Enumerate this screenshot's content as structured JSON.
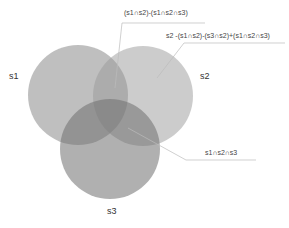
{
  "diagram": {
    "type": "venn",
    "sets": [
      {
        "id": "s1",
        "label": "s1"
      },
      {
        "id": "s2",
        "label": "s2"
      },
      {
        "id": "s3",
        "label": "s3"
      }
    ],
    "annotations": {
      "s1_s2_only": "(s1∩s2)-(s1∩s2∩s3)",
      "s2_only": "s2 -(s1∩s2)-(s3∩s2)+(s1∩s2∩s3)",
      "all_three": "s1∩s2∩s3"
    },
    "colors": {
      "circle": "#888888",
      "line": "#aaaaaa"
    }
  }
}
